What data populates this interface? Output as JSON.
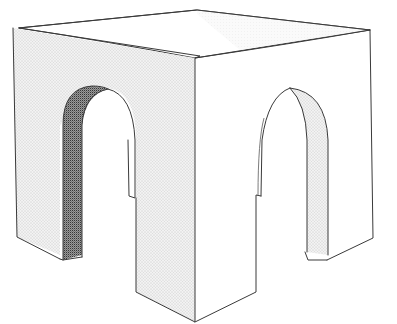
{
  "figure": {
    "subject": "Cubic pavilion with an arched opening on each visible face",
    "faces": [
      {
        "name": "top",
        "style": "open-outline"
      },
      {
        "name": "left-face",
        "style": "light-stipple",
        "opening": "round arch"
      },
      {
        "name": "right-face",
        "style": "blank",
        "opening": "round arch"
      },
      {
        "name": "left-arch-reveal",
        "style": "dark-stipple"
      },
      {
        "name": "right-arch-reveal",
        "style": "light-stipple"
      }
    ],
    "colors": {
      "line": "#3a3a3a",
      "paper": "#ffffff",
      "light_shade": "#e6e6e6",
      "dark_shade": "#8a8a8a"
    }
  }
}
